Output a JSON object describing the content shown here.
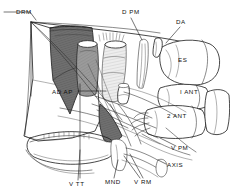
{
  "figure": {
    "kind": "anatomical-line-drawing",
    "style": "pen-and-ink stipple/hatched scientific illustration",
    "background_color": "#ffffff",
    "ink_color": "#1a1a1a",
    "width": 230,
    "height": 192
  },
  "labels": [
    {
      "id": "drm",
      "text": "DRM",
      "x": 16,
      "y": 14,
      "anchor": "start"
    },
    {
      "id": "dpm",
      "text": "D PM",
      "x": 122,
      "y": 14,
      "anchor": "start"
    },
    {
      "id": "da",
      "text": "DA",
      "x": 176,
      "y": 24,
      "anchor": "start"
    },
    {
      "id": "es",
      "text": "ES",
      "x": 178,
      "y": 62,
      "anchor": "start"
    },
    {
      "id": "ad_ap",
      "text": "AD AP",
      "x": 52,
      "y": 94,
      "anchor": "start"
    },
    {
      "id": "i_ant",
      "text": "I ANT",
      "x": 180,
      "y": 94,
      "anchor": "start"
    },
    {
      "id": "2_ant",
      "text": "2 ANT",
      "x": 167,
      "y": 118,
      "anchor": "start"
    },
    {
      "id": "v_pm",
      "text": "V PM",
      "x": 171,
      "y": 150,
      "anchor": "start"
    },
    {
      "id": "axis",
      "text": "AXIS",
      "x": 167,
      "y": 167,
      "anchor": "start"
    },
    {
      "id": "v_tt",
      "text": "V TT",
      "x": 69,
      "y": 186,
      "anchor": "start"
    },
    {
      "id": "mnd",
      "text": "MND",
      "x": 105,
      "y": 184,
      "anchor": "start"
    },
    {
      "id": "v_rm",
      "text": "V RM",
      "x": 134,
      "y": 184,
      "anchor": "start"
    }
  ],
  "legend_glossary": [
    {
      "abbr": "DRM",
      "note": "dorsal rectus muscle marker"
    },
    {
      "abbr": "D PM",
      "note": "dorsal pterygoid muscle marker"
    },
    {
      "abbr": "DA",
      "note": "dorsal arch marker"
    },
    {
      "abbr": "ES",
      "note": "epistropheus / skull segment marker"
    },
    {
      "abbr": "AD AP",
      "note": "adductor aponeurosis marker"
    },
    {
      "abbr": "I ANT",
      "note": "first anterior vertebra marker"
    },
    {
      "abbr": "2 ANT",
      "note": "second anterior vertebra marker"
    },
    {
      "abbr": "V PM",
      "note": "ventral pterygoid muscle marker"
    },
    {
      "abbr": "AXIS",
      "note": "axis vertebra marker"
    },
    {
      "abbr": "V TT",
      "note": "ventral tendon marker"
    },
    {
      "abbr": "MND",
      "note": "mandible marker"
    },
    {
      "abbr": "V RM",
      "note": "ventral rectus muscle marker"
    }
  ]
}
